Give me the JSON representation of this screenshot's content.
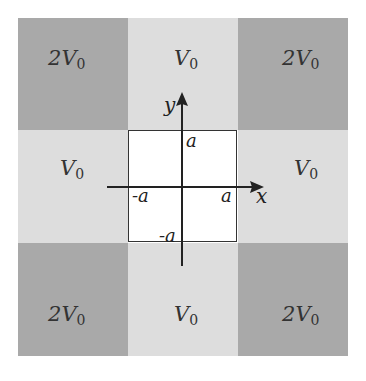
{
  "diagram": {
    "grid": {
      "rows": 3,
      "cols": 3,
      "colors": {
        "dark": "#a9a9a9",
        "light": "#dddddd",
        "center": "#ffffff"
      },
      "cells": [
        {
          "row": 0,
          "col": 0,
          "label_coef": "2",
          "label_var": "V",
          "label_sub": "0",
          "shade": "dark"
        },
        {
          "row": 0,
          "col": 1,
          "label_coef": "",
          "label_var": "V",
          "label_sub": "0",
          "shade": "light"
        },
        {
          "row": 0,
          "col": 2,
          "label_coef": "2",
          "label_var": "V",
          "label_sub": "0",
          "shade": "dark"
        },
        {
          "row": 1,
          "col": 0,
          "label_coef": "",
          "label_var": "V",
          "label_sub": "0",
          "shade": "light"
        },
        {
          "row": 1,
          "col": 1,
          "label_coef": "",
          "label_var": "",
          "label_sub": "",
          "shade": "center"
        },
        {
          "row": 1,
          "col": 2,
          "label_coef": "",
          "label_var": "V",
          "label_sub": "0",
          "shade": "light"
        },
        {
          "row": 2,
          "col": 0,
          "label_coef": "2",
          "label_var": "V",
          "label_sub": "0",
          "shade": "dark"
        },
        {
          "row": 2,
          "col": 1,
          "label_coef": "",
          "label_var": "V",
          "label_sub": "0",
          "shade": "light"
        },
        {
          "row": 2,
          "col": 2,
          "label_coef": "2",
          "label_var": "V",
          "label_sub": "0",
          "shade": "dark"
        }
      ]
    },
    "axes": {
      "x_label": "x",
      "y_label": "y",
      "ticks": {
        "pos_x": "a",
        "neg_x": "-a",
        "pos_y": "a",
        "neg_y": "-a"
      }
    }
  }
}
